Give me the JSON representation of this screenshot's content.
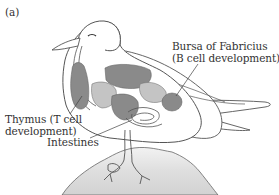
{
  "figure": {
    "panel_label": "(a)",
    "labels": {
      "bursa_line1": "Bursa of Fabricius",
      "bursa_line2": "(B cell development)",
      "thymus_line1": "Thymus (T cell",
      "thymus_line2": "development)",
      "intestines": "Intestines"
    },
    "colors": {
      "outline": "#555555",
      "organ_dark": "#8a8a8a",
      "organ_light": "#c4c4c4",
      "body_fill": "#ffffff",
      "rock_fill": "#e2e2e2",
      "text": "#333333"
    }
  }
}
